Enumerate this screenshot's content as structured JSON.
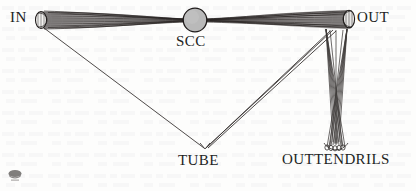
{
  "figure": {
    "type": "node-link-diagram",
    "background_color": "#fdfdfc",
    "ink_color": "#231f1e",
    "scc_fill_color": "#b9b9b9"
  },
  "labels": {
    "in": "IN",
    "out": "OUT",
    "scc": "SCC",
    "tube": "TUBE",
    "outtendrils": "OUTTENDRILS"
  },
  "nodes": [
    {
      "name": "in",
      "label": "IN",
      "shape": "cone-left",
      "cx": 44,
      "cy": 20,
      "label_x": 10,
      "label_y": 9
    },
    {
      "name": "scc",
      "label": "SCC",
      "shape": "circle",
      "cx": 195,
      "cy": 20,
      "r": 12,
      "label_x": 176,
      "label_y": 33
    },
    {
      "name": "out",
      "label": "OUT",
      "shape": "cone-right",
      "cx": 346,
      "cy": 19,
      "label_x": 357,
      "label_y": 9
    },
    {
      "name": "tube",
      "label": "TUBE",
      "shape": "apex",
      "cx": 205,
      "cy": 148,
      "label_x": 178,
      "label_y": 152
    },
    {
      "name": "outtendrils",
      "label": "OUTTENDRILS",
      "shape": "brush-bundle",
      "cx": 336,
      "cy": 90,
      "label_x": 282,
      "label_y": 151
    }
  ],
  "edges": [
    {
      "from": "in",
      "to": "scc",
      "style": "bundle"
    },
    {
      "from": "scc",
      "to": "out",
      "style": "bundle"
    },
    {
      "from": "in",
      "to": "tube",
      "style": "single-line"
    },
    {
      "from": "out",
      "to": "tube",
      "style": "double-line"
    },
    {
      "from": "out",
      "to": "outtendrils",
      "style": "crossed-bundle"
    }
  ],
  "artifacts": {
    "watermark": "scan-logo-blob",
    "page_bleed_through": true
  }
}
